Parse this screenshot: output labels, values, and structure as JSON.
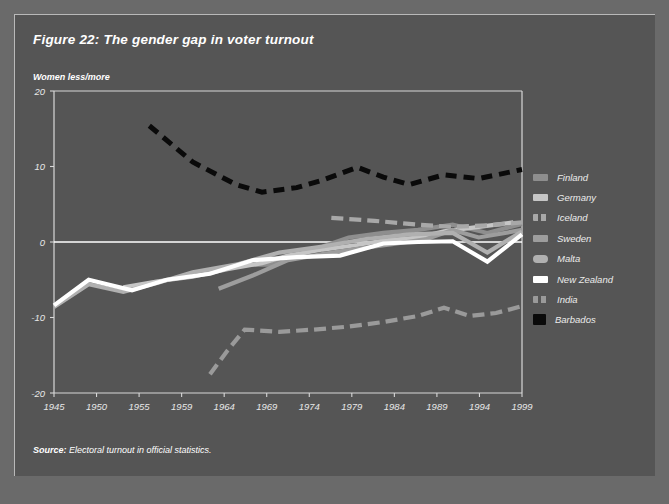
{
  "figure": {
    "title": "Figure 22: The gender gap in voter turnout",
    "y_caption": "Women less/more",
    "source_label": "Source:",
    "source_text": " Electoral turnout in official statistics."
  },
  "legend": {
    "items": [
      {
        "label": "Finland",
        "color": "#8e8e8e",
        "dash": "none"
      },
      {
        "label": "Germany",
        "color": "#c6c6c6",
        "dash": "none"
      },
      {
        "label": "Iceland",
        "color": "#a8a8a8",
        "dash": "dashed"
      },
      {
        "label": "Sweden",
        "color": "#9d9d9d",
        "dash": "none"
      },
      {
        "label": "Malta",
        "color": "#b0b0b0",
        "dash": "none"
      },
      {
        "label": "New Zealand",
        "color": "#ffffff",
        "dash": "none"
      },
      {
        "label": "India",
        "color": "#9a9a9a",
        "dash": "dashed"
      },
      {
        "label": "Barbados",
        "color": "#0a0a0a",
        "dash": "dashed"
      }
    ]
  },
  "chart_data": {
    "type": "line",
    "title": "Figure 22: The gender gap in voter turnout",
    "subtitle": "",
    "xlabel": "",
    "ylabel": "Women less/more",
    "ylim": [
      -20,
      20
    ],
    "yticks": [
      20,
      10,
      0,
      -10,
      -20
    ],
    "categories": [
      "1945",
      "1950",
      "1955",
      "1959",
      "1964",
      "1969",
      "1974",
      "1979",
      "1984",
      "1989",
      "1994",
      "1999"
    ],
    "grid": false,
    "zero_line": true,
    "legend_position": "right",
    "series": [
      {
        "name": "Finland",
        "color": "#8e8e8e",
        "dash": "none",
        "points": [
          {
            "x": 1966,
            "y": -3.0
          },
          {
            "x": 1970,
            "y": -3.0
          },
          {
            "x": 1975,
            "y": -1.0
          },
          {
            "x": 1979,
            "y": 0.6
          },
          {
            "x": 1983,
            "y": 1.2
          },
          {
            "x": 1987,
            "y": 1.6
          },
          {
            "x": 1991,
            "y": 2.3
          },
          {
            "x": 1995,
            "y": 1.2
          },
          {
            "x": 1999,
            "y": 2.4
          }
        ]
      },
      {
        "name": "Germany",
        "color": "#c6c6c6",
        "dash": "none",
        "points": [
          {
            "x": 1953,
            "y": -6.0
          },
          {
            "x": 1957,
            "y": -5.2
          },
          {
            "x": 1961,
            "y": -4.6
          },
          {
            "x": 1965,
            "y": -3.6
          },
          {
            "x": 1969,
            "y": -2.8
          },
          {
            "x": 1972,
            "y": -1.8
          },
          {
            "x": 1976,
            "y": -1.0
          },
          {
            "x": 1980,
            "y": -0.4
          },
          {
            "x": 1983,
            "y": 0.2
          },
          {
            "x": 1987,
            "y": 0.6
          },
          {
            "x": 1990,
            "y": 1.4
          },
          {
            "x": 1994,
            "y": 2.0
          },
          {
            "x": 1998,
            "y": 2.6
          }
        ]
      },
      {
        "name": "Iceland",
        "color": "#a8a8a8",
        "dash": "dashed",
        "points": [
          {
            "x": 1977,
            "y": 3.2
          },
          {
            "x": 1982,
            "y": 2.8
          },
          {
            "x": 1987,
            "y": 2.3
          },
          {
            "x": 1991,
            "y": 2.0
          },
          {
            "x": 1995,
            "y": 2.2
          },
          {
            "x": 1999,
            "y": 2.6
          }
        ]
      },
      {
        "name": "Sweden",
        "color": "#9d9d9d",
        "dash": "none",
        "points": [
          {
            "x": 1964,
            "y": -6.2
          },
          {
            "x": 1968,
            "y": -4.4
          },
          {
            "x": 1972,
            "y": -2.4
          },
          {
            "x": 1976,
            "y": -1.6
          },
          {
            "x": 1980,
            "y": -0.9
          },
          {
            "x": 1984,
            "y": -0.3
          },
          {
            "x": 1988,
            "y": 0.4
          },
          {
            "x": 1991,
            "y": 1.6
          },
          {
            "x": 1994,
            "y": 0.6
          },
          {
            "x": 1999,
            "y": 1.6
          }
        ]
      },
      {
        "name": "Malta",
        "color": "#b0b0b0",
        "dash": "none",
        "points": [
          {
            "x": 1945,
            "y": -8.6
          },
          {
            "x": 1949,
            "y": -5.6
          },
          {
            "x": 1953,
            "y": -6.6
          },
          {
            "x": 1957,
            "y": -5.4
          },
          {
            "x": 1961,
            "y": -4.0
          },
          {
            "x": 1966,
            "y": -3.0
          },
          {
            "x": 1971,
            "y": -1.4
          },
          {
            "x": 1976,
            "y": -0.6
          },
          {
            "x": 1981,
            "y": 0.4
          },
          {
            "x": 1986,
            "y": 1.0
          },
          {
            "x": 1991,
            "y": 1.2
          },
          {
            "x": 1995,
            "y": -1.4
          },
          {
            "x": 1999,
            "y": 1.4
          }
        ]
      },
      {
        "name": "New Zealand",
        "color": "#ffffff",
        "dash": "none",
        "points": [
          {
            "x": 1945,
            "y": -8.4
          },
          {
            "x": 1949,
            "y": -5.0
          },
          {
            "x": 1954,
            "y": -6.4
          },
          {
            "x": 1958,
            "y": -5.0
          },
          {
            "x": 1963,
            "y": -4.2
          },
          {
            "x": 1968,
            "y": -2.4
          },
          {
            "x": 1973,
            "y": -2.0
          },
          {
            "x": 1978,
            "y": -1.8
          },
          {
            "x": 1983,
            "y": -0.2
          },
          {
            "x": 1987,
            "y": 0.0
          },
          {
            "x": 1991,
            "y": 0.1
          },
          {
            "x": 1995,
            "y": -2.6
          },
          {
            "x": 1999,
            "y": 1.0
          }
        ]
      },
      {
        "name": "India",
        "color": "#9a9a9a",
        "dash": "dashed",
        "points": [
          {
            "x": 1963,
            "y": -17.5
          },
          {
            "x": 1965,
            "y": -14.4
          },
          {
            "x": 1967,
            "y": -11.6
          },
          {
            "x": 1971,
            "y": -11.9
          },
          {
            "x": 1975,
            "y": -11.6
          },
          {
            "x": 1979,
            "y": -11.2
          },
          {
            "x": 1983,
            "y": -10.6
          },
          {
            "x": 1987,
            "y": -9.8
          },
          {
            "x": 1990,
            "y": -8.7
          },
          {
            "x": 1993,
            "y": -9.8
          },
          {
            "x": 1996,
            "y": -9.4
          },
          {
            "x": 1999,
            "y": -8.5
          }
        ]
      },
      {
        "name": "Barbados",
        "color": "#0a0a0a",
        "dash": "dashed",
        "points": [
          {
            "x": 1956,
            "y": 15.4
          },
          {
            "x": 1961,
            "y": 10.6
          },
          {
            "x": 1966,
            "y": 7.6
          },
          {
            "x": 1969,
            "y": 6.6
          },
          {
            "x": 1973,
            "y": 7.2
          },
          {
            "x": 1976,
            "y": 8.2
          },
          {
            "x": 1980,
            "y": 9.9
          },
          {
            "x": 1983,
            "y": 8.6
          },
          {
            "x": 1986,
            "y": 7.6
          },
          {
            "x": 1990,
            "y": 8.9
          },
          {
            "x": 1994,
            "y": 8.4
          },
          {
            "x": 1999,
            "y": 9.6
          }
        ]
      }
    ]
  }
}
